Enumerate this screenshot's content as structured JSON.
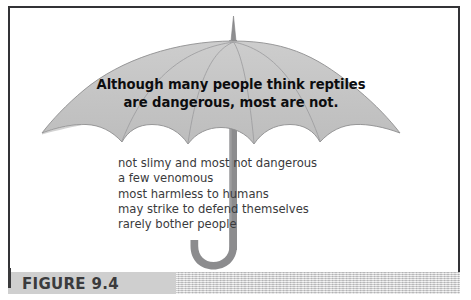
{
  "figure": {
    "caption_label": "FIGURE 9.4",
    "frame_color": "#333336",
    "background_color": "#ffffff",
    "caption_band_color": "#d3d3d3",
    "caption_text_color": "#3b3b3d"
  },
  "umbrella": {
    "canopy_fill": "#c5c5c5",
    "canopy_stroke": "#8e8e90",
    "rib_color": "#9a9a9c",
    "shaft_color": "#8c8c8e",
    "finial_color": "#8e8e90",
    "panel_count": 6,
    "scallop_count": 5,
    "icon_name": "umbrella-icon"
  },
  "canopy_message": {
    "lines": [
      "Although many people think reptiles",
      "are dangerous, most are not."
    ],
    "text_color": "#0d0d0f"
  },
  "fact_list": {
    "text_color": "#3a3a3c",
    "items": [
      "not slimy and most not dangerous",
      "a few venomous",
      "most harmless to humans",
      "may strike to defend themselves",
      "rarely bother people"
    ]
  }
}
